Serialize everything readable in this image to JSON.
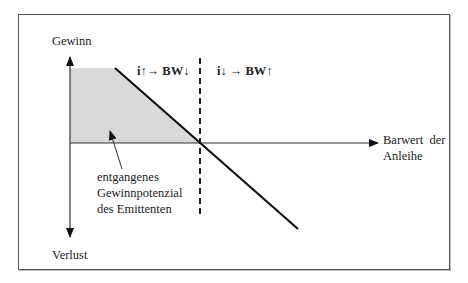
{
  "diagram": {
    "colors": {
      "line": "#111111",
      "axis": "#333333",
      "shaded_area": "#d9d9d9",
      "frame_border": "#555555",
      "background": "#ffffff"
    },
    "y_axis": {
      "top_label": "Gewinn",
      "bottom_label": "Verlust"
    },
    "x_axis": {
      "label_lines": [
        "Barwert der",
        "Anleihe"
      ]
    },
    "annotations": {
      "left_region": "i↑→ BW↓",
      "right_region": "i↓ → BW↑"
    },
    "shaded_region": {
      "label_lines": [
        "entgangenes",
        "Gewinnpotenzial",
        "des Emittenten"
      ]
    },
    "geometry": {
      "origin": [
        70,
        143
      ],
      "y_axis_top": 57,
      "y_axis_bottom": 237,
      "x_axis_end": 378,
      "cap_level_y": 68,
      "cap_end_x": 115,
      "breakeven_x": 200,
      "payoff_line_end": [
        298,
        229
      ],
      "dashed_line_top": 58,
      "dashed_line_bottom": 216,
      "leader_from": [
        122,
        169
      ],
      "leader_to": [
        110,
        131
      ]
    }
  }
}
